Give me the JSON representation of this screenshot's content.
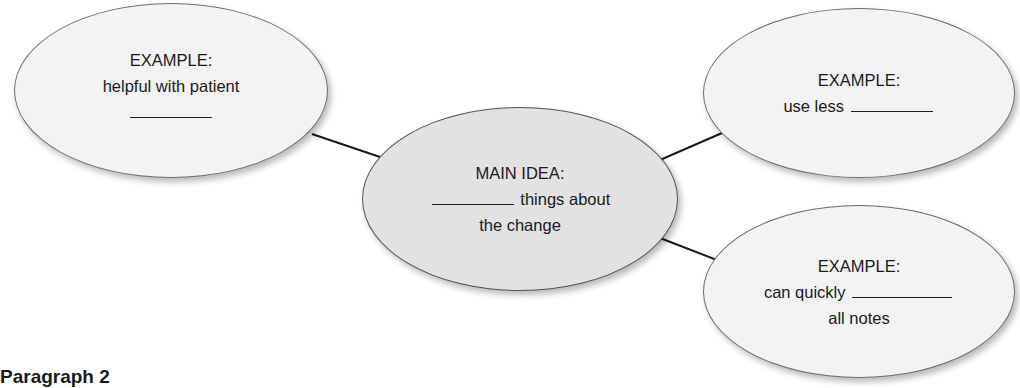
{
  "diagram": {
    "type": "idea-map",
    "main_idea": {
      "label": "MAIN IDEA:",
      "line1_after_blank": "things about",
      "line2": "the change"
    },
    "examples": [
      {
        "position": "left",
        "label": "EXAMPLE:",
        "line1": "helpful with patient",
        "has_blank_line": true
      },
      {
        "position": "top-right",
        "label": "EXAMPLE:",
        "line1_before_blank": "use less"
      },
      {
        "position": "bottom-right",
        "label": "EXAMPLE:",
        "line1_before_blank": "can quickly",
        "line2": "all notes"
      }
    ]
  },
  "footer": {
    "heading_partial": "Paragraph 2"
  },
  "colors": {
    "bubble_fill": "#f3f3f3",
    "main_fill": "#e2e2e2",
    "outline": "#6e6e6e",
    "connector": "#1a1a1a"
  }
}
